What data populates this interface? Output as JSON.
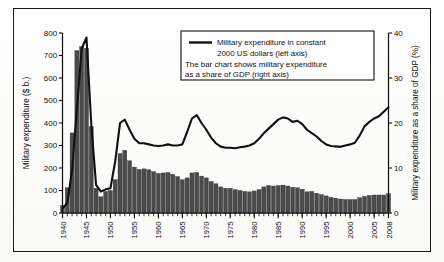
{
  "figure": {
    "frame_color": "#1b1b1b",
    "background": "#ffffff"
  },
  "legend": {
    "line_sample_name": "line-sample-swatch",
    "lines": [
      "Military expenditure in constant",
      "2000 US dollars (left axis)",
      "The bar chart shows military expenditure",
      "as a share of GDP (right axis)"
    ]
  },
  "chart_data": {
    "type": "bar",
    "title": "",
    "subtitle": "",
    "xlabel": "",
    "ylabel": "Military expenditure ($ b.)",
    "y2label": "Military expenditure as a share of GDP (%)",
    "ylim": [
      0,
      800
    ],
    "y2lim": [
      0,
      40
    ],
    "yticks": [
      0,
      100,
      200,
      300,
      400,
      500,
      600,
      700,
      800
    ],
    "y2ticks": [
      0,
      10,
      20,
      30,
      40
    ],
    "xlim": [
      1940,
      2008
    ],
    "xticks": [
      1940,
      1945,
      1950,
      1955,
      1960,
      1965,
      1970,
      1975,
      1980,
      1985,
      1990,
      1995,
      2000,
      2005,
      2008
    ],
    "xtick_labels": [
      "1940",
      "1945",
      "1950",
      "1955",
      "1960",
      "1965",
      "1970",
      "1975",
      "1980",
      "1985",
      "1990",
      "1995",
      "2000",
      "2005",
      "2008"
    ],
    "minor_xticks_every": 1,
    "grid": false,
    "legend_position": "upper-right-inside",
    "bar_color": "#4a4a4a",
    "line_color": "#111111",
    "x": [
      1940,
      1941,
      1942,
      1943,
      1944,
      1945,
      1946,
      1947,
      1948,
      1949,
      1950,
      1951,
      1952,
      1953,
      1954,
      1955,
      1956,
      1957,
      1958,
      1959,
      1960,
      1961,
      1962,
      1963,
      1964,
      1965,
      1966,
      1967,
      1968,
      1969,
      1970,
      1971,
      1972,
      1973,
      1974,
      1975,
      1976,
      1977,
      1978,
      1979,
      1980,
      1981,
      1982,
      1983,
      1984,
      1985,
      1986,
      1987,
      1988,
      1989,
      1990,
      1991,
      1992,
      1993,
      1994,
      1995,
      1996,
      1997,
      1998,
      1999,
      2000,
      2001,
      2002,
      2003,
      2004,
      2005,
      2006,
      2007,
      2008
    ],
    "series": [
      {
        "name": "Military expenditure in constant 2000 US dollars (left axis)",
        "axis": "left",
        "render": "line",
        "unit": "$ b.",
        "values": [
          20,
          45,
          190,
          460,
          730,
          780,
          395,
          125,
          95,
          105,
          110,
          230,
          400,
          415,
          370,
          330,
          310,
          310,
          305,
          300,
          298,
          300,
          305,
          300,
          300,
          305,
          360,
          420,
          435,
          400,
          370,
          335,
          310,
          295,
          290,
          290,
          288,
          292,
          295,
          300,
          310,
          330,
          355,
          375,
          395,
          415,
          425,
          420,
          405,
          410,
          395,
          370,
          355,
          340,
          320,
          305,
          298,
          296,
          294,
          300,
          305,
          312,
          345,
          385,
          405,
          420,
          430,
          450,
          470
        ]
      },
      {
        "name": "Military expenditure as a share of GDP (right axis)",
        "axis": "right",
        "render": "bar",
        "unit": "%",
        "values": [
          1.7,
          5.6,
          17.8,
          36.1,
          37.0,
          36.6,
          19.2,
          5.5,
          3.6,
          4.8,
          5.0,
          7.4,
          13.2,
          13.9,
          11.6,
          10.2,
          9.7,
          9.8,
          9.6,
          9.2,
          8.8,
          8.9,
          9.0,
          8.6,
          8.1,
          7.4,
          7.8,
          8.9,
          9.0,
          8.2,
          7.8,
          7.0,
          6.5,
          5.8,
          5.5,
          5.5,
          5.2,
          5.0,
          4.8,
          4.7,
          4.9,
          5.2,
          5.8,
          6.1,
          6.0,
          6.1,
          6.2,
          6.0,
          5.7,
          5.6,
          5.3,
          4.7,
          4.8,
          4.4,
          4.1,
          3.8,
          3.5,
          3.3,
          3.1,
          3.0,
          3.0,
          3.0,
          3.4,
          3.7,
          3.9,
          4.0,
          4.0,
          4.0,
          4.3
        ]
      }
    ]
  }
}
